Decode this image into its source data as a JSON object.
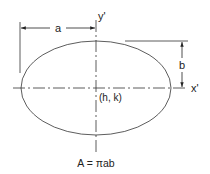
{
  "diagram": {
    "type": "ellipse-geometry",
    "labels": {
      "semi_major": "a",
      "semi_minor": "b",
      "x_axis": "x'",
      "y_axis": "y'",
      "center": "(h, k)",
      "area_formula": "A = πab"
    },
    "colors": {
      "line": "#333333",
      "text": "#222222",
      "background": "#ffffff"
    }
  }
}
